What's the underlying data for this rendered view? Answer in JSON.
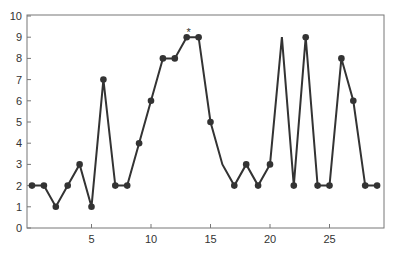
{
  "chart_data": {
    "type": "line",
    "title": "",
    "xlabel": "",
    "ylabel": "",
    "x": [
      0,
      1,
      2,
      3,
      4,
      5,
      6,
      7,
      8,
      9,
      10,
      11,
      12,
      13,
      14,
      15,
      16,
      17,
      18,
      19,
      20,
      21,
      22,
      23,
      24,
      25,
      26,
      27,
      28,
      29
    ],
    "series": [
      {
        "name": "series",
        "values": [
          2,
          2,
          1,
          2,
          3,
          1,
          7,
          2,
          2,
          4,
          6,
          8,
          8,
          9,
          9,
          5,
          3,
          2,
          3,
          2,
          3,
          9,
          2,
          9,
          2,
          2,
          8,
          6,
          2,
          2
        ],
        "markers": [
          true,
          true,
          true,
          true,
          true,
          true,
          true,
          true,
          true,
          true,
          true,
          true,
          true,
          true,
          true,
          true,
          false,
          true,
          true,
          true,
          true,
          false,
          true,
          true,
          true,
          true,
          true,
          true,
          true,
          true
        ]
      }
    ],
    "xlim": [
      -0.4,
      29.6
    ],
    "ylim": [
      0,
      10
    ],
    "xticks": [
      5,
      10,
      15,
      20,
      25
    ],
    "yticks": [
      0,
      1,
      2,
      3,
      4,
      5,
      6,
      7,
      8,
      9,
      10
    ],
    "grid": false,
    "legend": null,
    "annotations": [
      {
        "text": "*",
        "x": 13.5,
        "y": 9.3
      }
    ],
    "colors": {
      "line": "#333333",
      "axis": "#777777",
      "text": "#333333"
    }
  }
}
